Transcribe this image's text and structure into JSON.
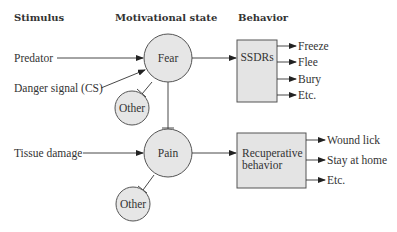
{
  "headers": {
    "stimulus": "Stimulus",
    "motivational_state": "Motivational state",
    "behavior": "Behavior"
  },
  "stimuli": {
    "predator": "Predator",
    "danger_signal": "Danger signal (CS)",
    "tissue_damage": "Tissue damage"
  },
  "states": {
    "fear": "Fear",
    "pain": "Pain",
    "other_top": "Other",
    "other_bottom": "Other"
  },
  "behavior_boxes": {
    "ssdrs": "SSDRs",
    "recuperative_line1": "Recuperative",
    "recuperative_line2": "behavior"
  },
  "fear_outputs": [
    "Freeze",
    "Flee",
    "Bury",
    "Etc."
  ],
  "pain_outputs": [
    "Wound lick",
    "Stay at home",
    "Etc."
  ],
  "colors": {
    "node_fill": "#e6e6e6",
    "box_fill": "#e4e4e4",
    "stroke": "#555555",
    "text": "#333333"
  }
}
